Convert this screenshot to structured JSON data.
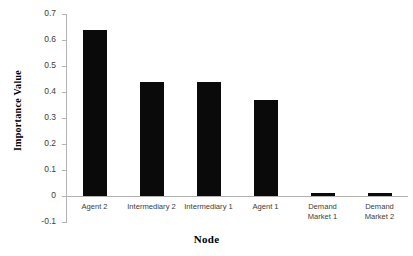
{
  "chart_data": {
    "type": "bar",
    "title": "",
    "xlabel": "Node",
    "ylabel": "Importance Value",
    "categories": [
      "Agent 2",
      "Intermediary 2",
      "Intermediary 1",
      "Agent 1",
      "Demand\nMarket 1",
      "Demand\nMarket 2"
    ],
    "values": [
      0.64,
      0.44,
      0.44,
      0.37,
      0.01,
      0.01
    ],
    "ylim": [
      -0.1,
      0.7
    ],
    "ytick_labels": [
      "0.7",
      "0.6",
      "0.5",
      "0.4",
      "0.3",
      "0.2",
      "0.1",
      "0",
      "-0.1"
    ],
    "ytick_values": [
      0.7,
      0.6,
      0.5,
      0.4,
      0.3,
      0.2,
      0.1,
      0,
      -0.1
    ],
    "grid": false,
    "legend": null,
    "bar_color": "#0a0a0a",
    "axis_color": "#b3b3b3"
  }
}
